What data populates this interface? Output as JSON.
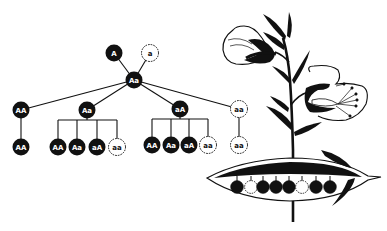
{
  "diagram": {
    "title": "",
    "colors": {
      "dominant": "#111111",
      "recessive": "#ffffff",
      "background": "#ffffff"
    },
    "parents": [
      {
        "id": "p1",
        "label": "A",
        "type": "dominant",
        "x": 114,
        "y": 53
      },
      {
        "id": "p2",
        "label": "a",
        "type": "recessive",
        "x": 150,
        "y": 53
      }
    ],
    "f1": {
      "id": "f1",
      "label": "Aa",
      "type": "dominant",
      "x": 134,
      "y": 80
    },
    "f2": [
      {
        "id": "g1",
        "label": "AA",
        "type": "dominant",
        "x": 21,
        "y": 110
      },
      {
        "id": "g2",
        "label": "Aa",
        "type": "dominant",
        "x": 87,
        "y": 110
      },
      {
        "id": "g3",
        "label": "aA",
        "type": "dominant",
        "x": 180,
        "y": 109
      },
      {
        "id": "g4",
        "label": "aa",
        "type": "recessive",
        "x": 239,
        "y": 109
      }
    ],
    "f3": [
      {
        "parent": "g1",
        "children": [
          {
            "label": "AA",
            "type": "dominant",
            "x": 21,
            "y": 147
          }
        ]
      },
      {
        "parent": "g2",
        "children": [
          {
            "label": "AA",
            "type": "dominant",
            "x": 58,
            "y": 147
          },
          {
            "label": "Aa",
            "type": "dominant",
            "x": 77,
            "y": 147
          },
          {
            "label": "aA",
            "type": "dominant",
            "x": 97,
            "y": 147
          },
          {
            "label": "aa",
            "type": "recessive",
            "x": 117,
            "y": 147
          }
        ]
      },
      {
        "parent": "g3",
        "children": [
          {
            "label": "AA",
            "type": "dominant",
            "x": 152,
            "y": 145
          },
          {
            "label": "Aa",
            "type": "dominant",
            "x": 171,
            "y": 145
          },
          {
            "label": "aA",
            "type": "dominant",
            "x": 189,
            "y": 145
          },
          {
            "label": "aa",
            "type": "recessive",
            "x": 208,
            "y": 145
          }
        ]
      },
      {
        "parent": "g4",
        "children": [
          {
            "label": "aa",
            "type": "recessive",
            "x": 239,
            "y": 145
          }
        ]
      }
    ]
  },
  "illustration": {
    "subject": "pea plant with flowers and open pod",
    "pod_peas": [
      "dark",
      "light",
      "dark",
      "dark",
      "dark",
      "light",
      "dark",
      "dark"
    ],
    "pea_x": [
      237,
      251,
      263,
      276,
      289,
      302,
      316,
      330
    ],
    "pea_y": 187
  }
}
